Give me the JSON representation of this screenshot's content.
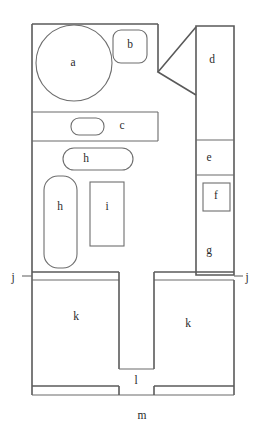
{
  "figure": {
    "type": "architectural-floor-plan",
    "title_top": "",
    "caption_bottom": "",
    "background_color": "#ffffff",
    "line_color": "#5a5a5a",
    "label_color": "#2b2b2b"
  },
  "rooms": [
    {
      "id": "a",
      "label": "a",
      "shape": "circle",
      "x": 73,
      "y": 63
    },
    {
      "id": "b",
      "label": "b",
      "shape": "rounded-rect",
      "x": 130,
      "y": 45
    },
    {
      "id": "c",
      "label": "c",
      "shape": "rect-band",
      "x": 122,
      "y": 126
    },
    {
      "id": "d",
      "label": "d",
      "shape": "rect",
      "x": 212,
      "y": 60
    },
    {
      "id": "e",
      "label": "e",
      "shape": "rect",
      "x": 209,
      "y": 158
    },
    {
      "id": "f",
      "label": "f",
      "shape": "square",
      "x": 216,
      "y": 196
    },
    {
      "id": "g",
      "label": "g",
      "shape": "rect",
      "x": 209,
      "y": 251
    },
    {
      "id": "h1",
      "label": "h",
      "shape": "rounded-rect-wide",
      "x": 86,
      "y": 159
    },
    {
      "id": "h2",
      "label": "h",
      "shape": "rounded-rect-tall",
      "x": 60,
      "y": 207
    },
    {
      "id": "i",
      "label": "i",
      "shape": "rect",
      "x": 107,
      "y": 207
    },
    {
      "id": "j1",
      "label": "j",
      "shape": "edge-marker",
      "x": 13,
      "y": 278
    },
    {
      "id": "j2",
      "label": "j",
      "shape": "edge-marker",
      "x": 247,
      "y": 278
    },
    {
      "id": "k1",
      "label": "k",
      "shape": "rect",
      "x": 76,
      "y": 317
    },
    {
      "id": "k2",
      "label": "k",
      "shape": "rect",
      "x": 188,
      "y": 324
    },
    {
      "id": "l",
      "label": "l",
      "shape": "rect",
      "x": 132,
      "y": 381
    },
    {
      "id": "m",
      "label": "m",
      "shape": "edge-marker",
      "x": 142,
      "y": 416
    }
  ],
  "legend": {
    "labels": [
      "a",
      "b",
      "c",
      "d",
      "e",
      "f",
      "g",
      "h",
      "h",
      "i",
      "j",
      "j",
      "k",
      "k",
      "l",
      "m"
    ]
  }
}
